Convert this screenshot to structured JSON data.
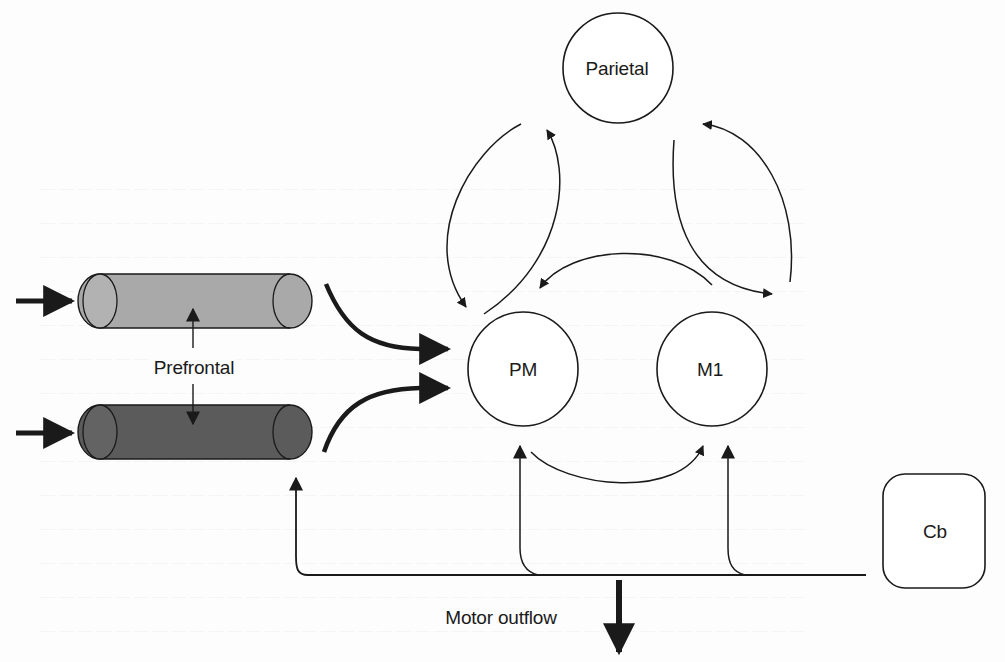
{
  "figure": {
    "kind": "brain motor-network schematic",
    "nodes": {
      "parietal": {
        "label": "Parietal",
        "shape": "circle"
      },
      "pm": {
        "label": "PM",
        "shape": "circle"
      },
      "m1": {
        "label": "M1",
        "shape": "circle"
      },
      "cb": {
        "label": "Cb",
        "shape": "rounded-rectangle"
      },
      "prefrontal": {
        "label": "Prefrontal",
        "shape": "two cylinders"
      }
    },
    "labels": {
      "motor_outflow": "Motor outflow"
    },
    "colors": {
      "line": "#1a1a1a",
      "cylinder_top": "#a9a9a9",
      "cylinder_top_cap": "#b4b4b4",
      "cylinder_bottom": "#5b5b5b",
      "cylinder_bottom_cap": "#646464",
      "background": "#fdfdfd"
    },
    "connections": [
      {
        "from": "parietal",
        "to": "pm",
        "style": "thin curved arrow"
      },
      {
        "from": "pm",
        "to": "parietal",
        "style": "thin curved arrow"
      },
      {
        "from": "parietal",
        "to": "m1",
        "style": "thin curved arrow"
      },
      {
        "from": "m1",
        "to": "parietal",
        "style": "thin curved arrow"
      },
      {
        "from": "m1",
        "to": "pm",
        "style": "thin curved arrow"
      },
      {
        "from": "pm",
        "to": "m1",
        "style": "thin curved arrow"
      },
      {
        "from": "prefrontal_top",
        "to": "pm",
        "style": "thick curved arrow"
      },
      {
        "from": "prefrontal_bottom",
        "to": "pm",
        "style": "thick curved arrow"
      },
      {
        "from": "prefrontal_top",
        "to": "prefrontal_bottom",
        "style": "bidirectional thin arrow"
      },
      {
        "from": "input",
        "to": "prefrontal_top",
        "style": "thick straight arrow"
      },
      {
        "from": "input",
        "to": "prefrontal_bottom",
        "style": "thick straight arrow"
      },
      {
        "from": "cb",
        "to": "pm",
        "style": "thin line arrow"
      },
      {
        "from": "cb",
        "to": "m1",
        "style": "thin line arrow"
      },
      {
        "from": "cb",
        "to": "prefrontal_bottom",
        "style": "thin line arrow"
      },
      {
        "from": "cb_line",
        "to": "motor_outflow",
        "style": "thick straight arrow down"
      }
    ]
  }
}
